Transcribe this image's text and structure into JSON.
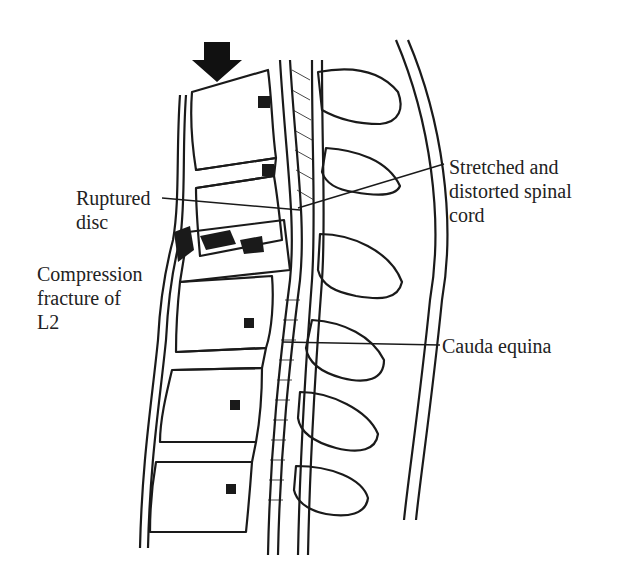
{
  "figure": {
    "arrow_icon": "down-arrow-icon (force direction)",
    "colors": {
      "ink": "#1a1a1a",
      "background": "#ffffff"
    }
  },
  "labels": {
    "ruptured_disc": {
      "line1": "Ruptured",
      "line2": "disc"
    },
    "compression_fracture": {
      "line1": "Compression",
      "line2": "fracture of",
      "line3": "L2"
    },
    "spinal_cord": {
      "line1": "Stretched and",
      "line2": "distorted spinal",
      "line3": "cord"
    },
    "cauda_equina": {
      "line1": "Cauda equina"
    }
  }
}
